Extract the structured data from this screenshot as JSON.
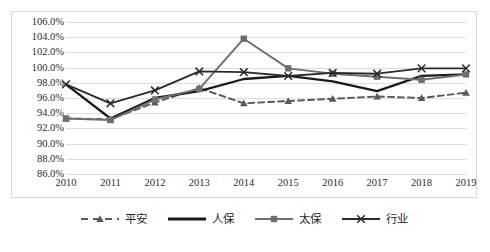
{
  "chart_data": {
    "type": "line",
    "title": "",
    "subtitle": "",
    "xlabel": "",
    "ylabel": "",
    "categories": [
      "2010",
      "2011",
      "2012",
      "2013",
      "2014",
      "2015",
      "2016",
      "2017",
      "2018",
      "2019"
    ],
    "ylim": [
      86.0,
      106.0
    ],
    "ytick_step": 2.0,
    "ytick_labels": [
      "106.0%",
      "104.0%",
      "102.0%",
      "100.0%",
      "98.0%",
      "96.0%",
      "94.0%",
      "92.0%",
      "90.0%",
      "88.0%",
      "86.0%"
    ],
    "ytick_values": [
      106.0,
      104.0,
      102.0,
      100.0,
      98.0,
      96.0,
      94.0,
      92.0,
      90.0,
      88.0,
      86.0
    ],
    "grid": true,
    "grid_color": "#dcdcdc",
    "legend_position": "bottom",
    "value_suffix": "%",
    "series": [
      {
        "name": "平安",
        "style": "dashed",
        "marker": "triangle",
        "color": "#595959",
        "values": [
          93.3,
          93.2,
          95.4,
          97.3,
          95.3,
          95.6,
          95.9,
          96.2,
          96.0,
          96.7
        ]
      },
      {
        "name": "人保",
        "style": "solid",
        "marker": "none",
        "color": "#1a1a1a",
        "values": [
          97.8,
          93.3,
          96.0,
          96.9,
          98.5,
          98.9,
          98.2,
          96.9,
          98.9,
          99.1
        ]
      },
      {
        "name": "太保",
        "style": "solid",
        "marker": "square",
        "color": "#6e6e6e",
        "values": [
          93.3,
          93.1,
          95.8,
          97.2,
          103.8,
          99.9,
          99.2,
          98.8,
          98.4,
          99.1
        ]
      },
      {
        "name": "行业",
        "style": "solid",
        "marker": "x",
        "color": "#2b2b2b",
        "values": [
          97.8,
          95.3,
          97.0,
          99.5,
          99.4,
          98.9,
          99.3,
          99.2,
          99.9,
          99.9
        ]
      }
    ]
  },
  "legend": {
    "items": [
      {
        "label": "平安"
      },
      {
        "label": "人保"
      },
      {
        "label": "太保"
      },
      {
        "label": "行业"
      }
    ]
  }
}
